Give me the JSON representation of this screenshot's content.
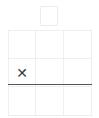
{
  "app": {
    "title": "Tic Tac Toe",
    "background_color": "#ffffff"
  },
  "colors": {
    "grid_line": "#efefef",
    "strike_line": "#555555",
    "mark": "#3a3a3a",
    "tile_border": "#ececec"
  },
  "held_tile": {
    "name": "held-tile",
    "mark": "",
    "visible": true,
    "x": 40,
    "y": 6,
    "width": 18,
    "height": 20
  },
  "board": {
    "rows": 3,
    "columns": 3,
    "x": 8,
    "y": 30,
    "width": 84,
    "height": 86,
    "cells": [
      {
        "id": "r0c0",
        "mark": ""
      },
      {
        "id": "r0c1",
        "mark": ""
      },
      {
        "id": "r0c2",
        "mark": ""
      },
      {
        "id": "r1c0",
        "mark": "✕"
      },
      {
        "id": "r1c1",
        "mark": ""
      },
      {
        "id": "r1c2",
        "mark": ""
      },
      {
        "id": "r2c0",
        "mark": ""
      },
      {
        "id": "r2c1",
        "mark": ""
      },
      {
        "id": "r2c2",
        "mark": ""
      }
    ]
  },
  "strike_line": {
    "name": "strike-line",
    "visible": true,
    "x": 8,
    "y": 84,
    "width": 84,
    "thickness": 1
  }
}
